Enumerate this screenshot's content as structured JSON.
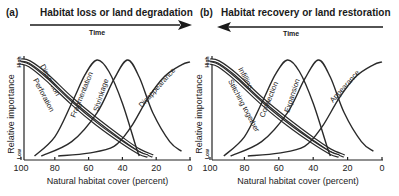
{
  "chart_data": [
    {
      "type": "line",
      "panel_label": "(a)",
      "title": "Habitat loss or land degradation",
      "arrow_direction": "right",
      "arrow_label": "Time",
      "xlabel": "Natural habitat cover (percent)",
      "ylabel": "Relative importance",
      "y_high_label": "High",
      "y_low_label": "Low",
      "xlim": [
        100,
        0
      ],
      "ylim": [
        0,
        1
      ],
      "x_ticks": [
        100,
        80,
        60,
        40,
        20,
        0
      ],
      "grid": false,
      "series": [
        {
          "name": "Dissection",
          "style": "double",
          "points": [
            [
              100,
              1.0
            ],
            [
              95,
              0.98
            ],
            [
              85,
              0.85
            ],
            [
              70,
              0.6
            ],
            [
              55,
              0.38
            ],
            [
              40,
              0.18
            ],
            [
              30,
              0.06
            ],
            [
              22,
              0.0
            ]
          ]
        },
        {
          "name": "Perforation",
          "style": "double",
          "points": [
            [
              100,
              0.97
            ],
            [
              95,
              0.94
            ],
            [
              85,
              0.8
            ],
            [
              70,
              0.55
            ],
            [
              55,
              0.33
            ],
            [
              40,
              0.14
            ],
            [
              30,
              0.03
            ],
            [
              25,
              0.0
            ]
          ]
        },
        {
          "name": "Fragmentation",
          "style": "single",
          "points": [
            [
              92,
              0.0
            ],
            [
              80,
              0.2
            ],
            [
              70,
              0.55
            ],
            [
              62,
              0.85
            ],
            [
              55,
              1.0
            ],
            [
              48,
              0.88
            ],
            [
              40,
              0.55
            ],
            [
              32,
              0.1
            ],
            [
              30,
              0.0
            ]
          ]
        },
        {
          "name": "Shrinkage",
          "style": "single",
          "points": [
            [
              88,
              0.0
            ],
            [
              70,
              0.15
            ],
            [
              55,
              0.45
            ],
            [
              45,
              0.8
            ],
            [
              37,
              1.0
            ],
            [
              30,
              0.82
            ],
            [
              22,
              0.45
            ],
            [
              12,
              0.15
            ],
            [
              5,
              0.05
            ]
          ]
        },
        {
          "name": "Disappearance",
          "style": "single",
          "points": [
            [
              78,
              0.0
            ],
            [
              60,
              0.03
            ],
            [
              45,
              0.1
            ],
            [
              35,
              0.3
            ],
            [
              25,
              0.6
            ],
            [
              15,
              0.83
            ],
            [
              5,
              0.95
            ],
            [
              0,
              0.98
            ]
          ]
        }
      ]
    },
    {
      "type": "line",
      "panel_label": "(b)",
      "title": "Habitat recovery or land restoration",
      "arrow_direction": "left",
      "arrow_label": "Time",
      "xlabel": "Natural habitat cover (percent)",
      "ylabel": "Relative importance",
      "y_high_label": "High",
      "y_low_label": "Low",
      "xlim": [
        100,
        0
      ],
      "ylim": [
        0,
        1
      ],
      "x_ticks": [
        100,
        80,
        60,
        40,
        20,
        0
      ],
      "grid": false,
      "series": [
        {
          "name": "Infilling",
          "style": "double",
          "points": [
            [
              100,
              1.0
            ],
            [
              95,
              0.98
            ],
            [
              85,
              0.85
            ],
            [
              70,
              0.6
            ],
            [
              55,
              0.38
            ],
            [
              40,
              0.18
            ],
            [
              30,
              0.06
            ],
            [
              22,
              0.0
            ]
          ]
        },
        {
          "name": "Stitching together",
          "style": "double",
          "points": [
            [
              100,
              0.97
            ],
            [
              95,
              0.94
            ],
            [
              85,
              0.8
            ],
            [
              70,
              0.55
            ],
            [
              55,
              0.33
            ],
            [
              40,
              0.14
            ],
            [
              30,
              0.03
            ],
            [
              25,
              0.0
            ]
          ]
        },
        {
          "name": "Connection",
          "style": "single",
          "points": [
            [
              92,
              0.0
            ],
            [
              80,
              0.2
            ],
            [
              70,
              0.55
            ],
            [
              62,
              0.85
            ],
            [
              55,
              1.0
            ],
            [
              48,
              0.88
            ],
            [
              40,
              0.55
            ],
            [
              32,
              0.1
            ],
            [
              30,
              0.0
            ]
          ]
        },
        {
          "name": "Expansion",
          "style": "single",
          "points": [
            [
              88,
              0.0
            ],
            [
              70,
              0.15
            ],
            [
              55,
              0.45
            ],
            [
              45,
              0.8
            ],
            [
              37,
              1.0
            ],
            [
              30,
              0.82
            ],
            [
              22,
              0.45
            ],
            [
              12,
              0.15
            ],
            [
              5,
              0.05
            ]
          ]
        },
        {
          "name": "Appearance",
          "style": "single",
          "points": [
            [
              78,
              0.0
            ],
            [
              60,
              0.03
            ],
            [
              45,
              0.1
            ],
            [
              35,
              0.3
            ],
            [
              25,
              0.6
            ],
            [
              15,
              0.83
            ],
            [
              5,
              0.95
            ],
            [
              0,
              0.98
            ]
          ]
        }
      ]
    }
  ],
  "panels": [
    {
      "label": "(a)",
      "title": "Habitat loss or land degradation",
      "time": "Time"
    },
    {
      "label": "(b)",
      "title": "Habitat recovery or land restoration",
      "time": "Time"
    }
  ]
}
